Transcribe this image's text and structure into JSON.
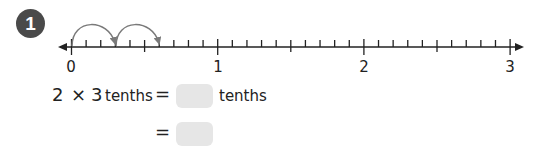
{
  "question": {
    "number": "1",
    "number_line": {
      "min": 0,
      "max": 3,
      "major_labels": [
        "0",
        "1",
        "2",
        "3"
      ],
      "subdivisions_per_unit": 10,
      "jumps": [
        {
          "from": 0,
          "to": 0.3
        },
        {
          "from": 0.3,
          "to": 0.6
        }
      ]
    },
    "equation_line1": {
      "left_a": "2",
      "times": "×",
      "left_b": "3",
      "left_unit": "tenths",
      "equals": "=",
      "answer_box": "",
      "right_unit": "tenths"
    },
    "equation_line2": {
      "equals": "=",
      "answer_box": ""
    }
  },
  "colors": {
    "badge": "#4a4a4a",
    "answer_box": "#e6e6e6",
    "arrow": "#7a7a7a",
    "line": "#222222"
  }
}
